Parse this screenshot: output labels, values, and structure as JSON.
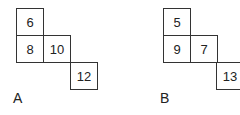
{
  "figures": [
    {
      "label": "A",
      "cells": [
        {
          "value": "6"
        },
        {
          "value": "8"
        },
        {
          "value": "10"
        },
        {
          "value": "12"
        }
      ]
    },
    {
      "label": "B",
      "cells": [
        {
          "value": "5"
        },
        {
          "value": "9"
        },
        {
          "value": "7"
        },
        {
          "value": "13"
        }
      ]
    }
  ]
}
